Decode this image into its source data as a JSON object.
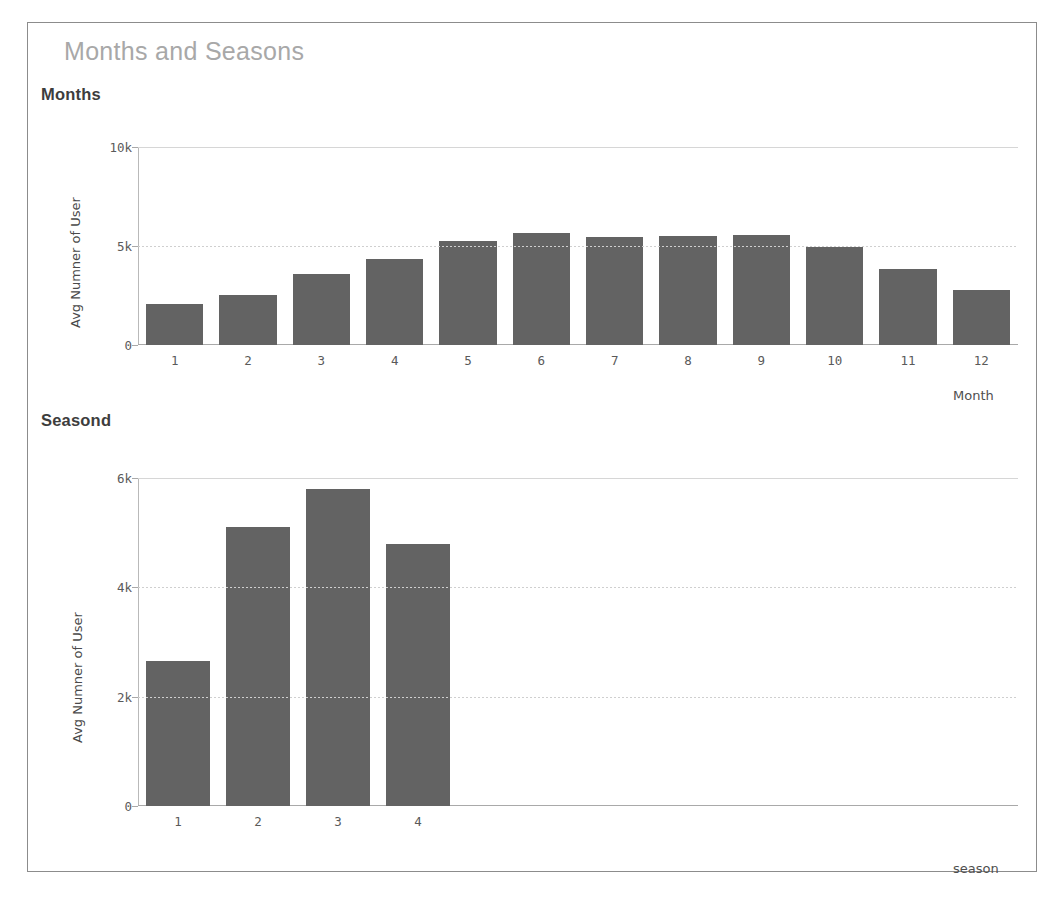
{
  "card": {
    "title": "Months and Seasons"
  },
  "sections": {
    "months": {
      "subtitle": "Months",
      "ylabel": "Avg Numner of User",
      "xcaption": "Month"
    },
    "seasons": {
      "subtitle": "Seasond",
      "ylabel": "Avg Numner of User",
      "xcaption": "season"
    }
  },
  "colors": {
    "bar": "#636363",
    "card_border": "#8c8c8c",
    "title": "#a8a8a8",
    "subtitle": "#3d3d3d",
    "axis": "#a9a9a9",
    "grid": "#cfcfcf",
    "tick_text": "#5a5a5a"
  },
  "chart_data": [
    {
      "type": "bar",
      "title": "Months",
      "xlabel": "Month",
      "ylabel": "Avg Numner of User",
      "categories": [
        "1",
        "2",
        "3",
        "4",
        "5",
        "6",
        "7",
        "8",
        "9",
        "10",
        "11",
        "12"
      ],
      "values": [
        2050,
        2550,
        3600,
        4350,
        5250,
        5650,
        5450,
        5500,
        5550,
        4950,
        3820,
        2800
      ],
      "ylim": [
        0,
        10000
      ],
      "yticks": [
        0,
        5000,
        10000
      ],
      "ytick_labels": [
        "0",
        "5k",
        "10k"
      ],
      "grid": true,
      "legend": "none"
    },
    {
      "type": "bar",
      "title": "Seasond",
      "xlabel": "season",
      "ylabel": "Avg Numner of User",
      "categories": [
        "1",
        "2",
        "3",
        "4"
      ],
      "values": [
        2650,
        5100,
        5800,
        4800
      ],
      "ylim": [
        0,
        6000
      ],
      "yticks": [
        0,
        2000,
        4000,
        6000
      ],
      "ytick_labels": [
        "0",
        "2k",
        "4k",
        "6k"
      ],
      "grid": true,
      "legend": "none"
    }
  ]
}
